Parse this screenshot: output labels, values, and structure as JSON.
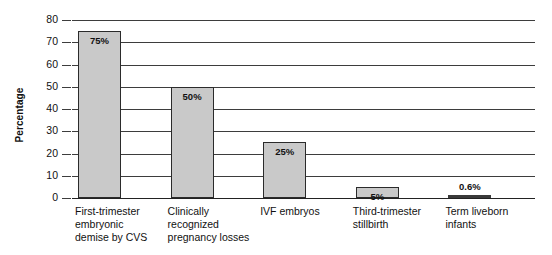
{
  "chart_data": {
    "type": "bar",
    "title": "",
    "subtitle": "",
    "xlabel": "",
    "ylabel": "Percentage",
    "ylim": [
      0,
      80
    ],
    "ytick_step": 10,
    "yticks": [
      "0",
      "10",
      "20",
      "30",
      "40",
      "50",
      "60",
      "70",
      "80"
    ],
    "grid": true,
    "legend": false,
    "legend_position": "none",
    "categories": [
      "First-trimester\nembryonic\ndemise by CVS",
      "Clinically\nrecognized\npregnancy losses",
      "IVF embryos",
      "Third-trimester\nstillbirth",
      "Term liveborn\ninfants"
    ],
    "values": [
      75,
      50,
      25,
      5,
      0.6
    ],
    "data_labels": [
      "75%",
      "50%",
      "25%",
      "5%",
      "0.6%"
    ],
    "colors": {
      "bar_fill": "#c9c9c9",
      "bar_edge": "#2b2b2b",
      "sliver_fill": "#3a3a3a",
      "gridline": "#3d3d3d",
      "axis": "#222222",
      "text": "#111111",
      "background": "#ffffff"
    }
  },
  "axis": {
    "y_title": "Percentage"
  }
}
